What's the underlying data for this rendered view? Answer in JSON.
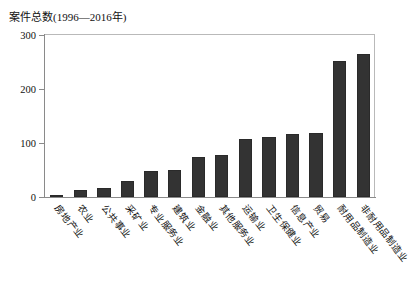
{
  "chart_data": {
    "type": "bar",
    "title": "案件总数(1996—2016年)",
    "xlabel": "",
    "ylabel": "",
    "ylim": [
      0,
      300
    ],
    "yticks": [
      0,
      100,
      200,
      300
    ],
    "grid": false,
    "legend": null,
    "bar_color": "#333333",
    "categories": [
      "房地产业",
      "农业",
      "公共事业",
      "采矿业",
      "专业服务业",
      "建筑业",
      "金融业",
      "其他服务业",
      "运输业",
      "卫生保健业",
      "信息产业",
      "贸易",
      "耐用品制造业",
      "非耐用品制造业"
    ],
    "values": [
      4,
      13,
      17,
      30,
      48,
      50,
      74,
      77,
      107,
      112,
      117,
      119,
      252,
      265
    ]
  },
  "figure": {
    "background": "#ffffff",
    "frame_color": "#b9b9b9",
    "axis_color": "#8a8a8a"
  }
}
